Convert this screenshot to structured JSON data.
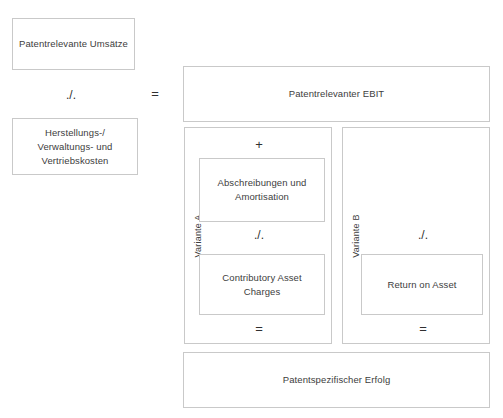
{
  "diagram": {
    "colors": {
      "border": "#c9c9c9",
      "text": "#3d3d3d",
      "background": "#ffffff"
    },
    "left_column": {
      "revenue_box": "Patentrelevante Umsätze",
      "minus_operator": "./.",
      "cost_box": "Herstellungs-/\nVerwaltungs- und\nVertriebskosten",
      "cost_box_line1": "Herstellungs-/",
      "cost_box_line2": "Verwaltungs- und",
      "cost_box_line3": "Vertriebskosten"
    },
    "equals_operator": "=",
    "right_column": {
      "ebit_box": "Patentrelevanter EBIT",
      "result_box": "Patentspezifischer Erfolg"
    },
    "variant_a": {
      "label": "Variante A",
      "plus_operator": "+",
      "depreciation_box_line1": "Abschreibungen und",
      "depreciation_box_line2": "Amortisation",
      "minus_operator": "./.",
      "cac_box_line1": "Contributory Asset",
      "cac_box_line2": "Charges",
      "equals_operator": "="
    },
    "variant_b": {
      "label": "Variante B",
      "minus_operator": "./.",
      "roa_box": "Return on Asset",
      "equals_operator": "="
    }
  }
}
